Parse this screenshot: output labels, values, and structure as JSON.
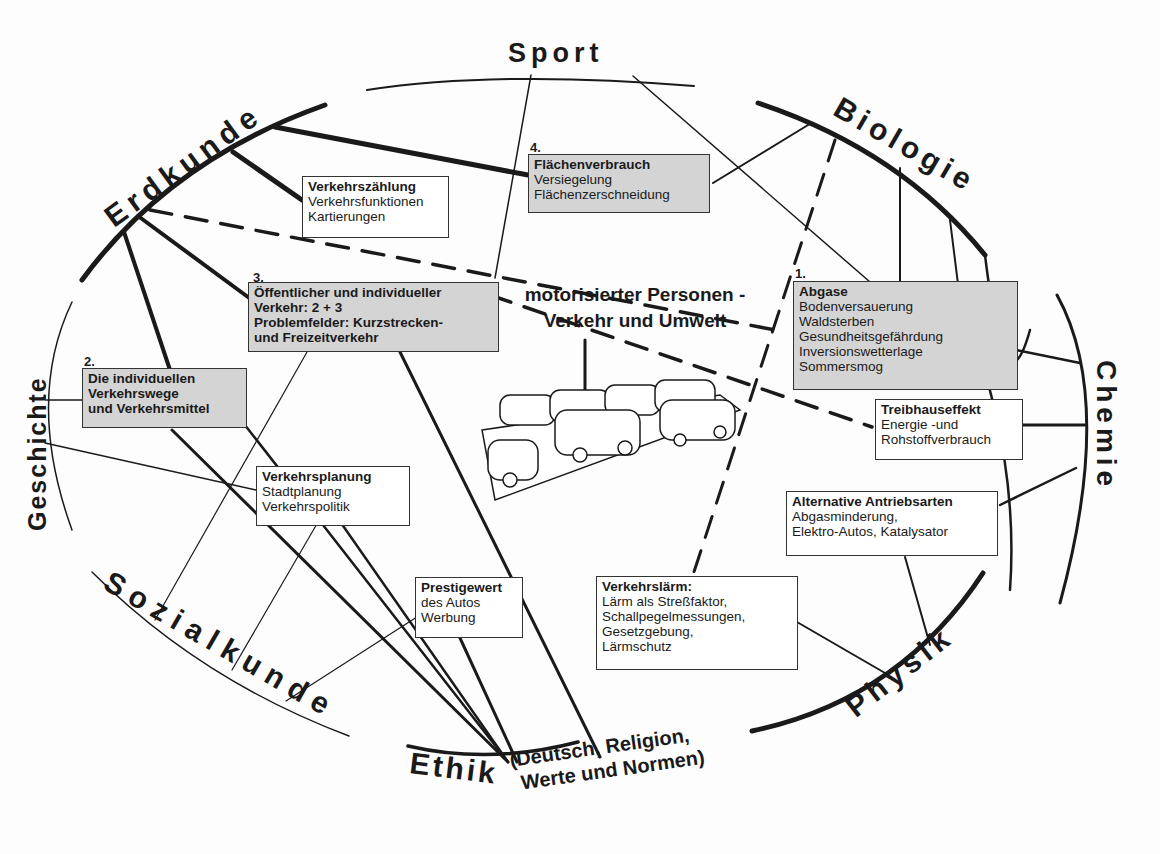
{
  "diagram": {
    "title_line1": "motorisierter Personen -",
    "title_line2": "Verkehr und Umwelt",
    "subjects": {
      "sport": "Sport",
      "biologie": "Biologie",
      "chemie": "Chemie",
      "physik": "Physik",
      "ethik": "Ethik",
      "ethik_sub1": "(Deutsch, Religion,",
      "ethik_sub2": "Werte und Normen)",
      "sozialkunde": "Sozialkunde",
      "geschichte": "Geschichte",
      "erdkunde": "Erdkunde"
    },
    "topics": {
      "abgase": {
        "number": "1.",
        "title": "Abgase",
        "lines": [
          "Bodenversauerung",
          "Waldsterben",
          "Gesundheitsgefährdung",
          "Inversionswetterlage",
          "Sommersmog"
        ]
      },
      "individuell": {
        "number": "2.",
        "lines": [
          "Die individuellen",
          "Verkehrswege",
          "und Verkehrsmittel"
        ]
      },
      "oeffentlich": {
        "number": "3.",
        "lines": [
          "Öffentlicher und individueller",
          "Verkehr: 2 + 3",
          "Problemfelder: Kurzstrecken-",
          "und Freizeitverkehr"
        ]
      },
      "flaechen": {
        "number": "4.",
        "title": "Flächenverbrauch",
        "lines": [
          "Versiegelung",
          "Flächenzerschneidung"
        ]
      },
      "zaehlung": {
        "title": "Verkehrszählung",
        "lines": [
          "Verkehrsfunktionen",
          "Kartierungen"
        ]
      },
      "treibhaus": {
        "title": "Treibhauseffekt",
        "lines": [
          "Energie -und",
          "Rohstoffverbrauch"
        ]
      },
      "antrieb": {
        "title": "Alternative Antriebsarten",
        "lines": [
          "Abgasminderung,",
          "Elektro-Autos, Katalysator"
        ]
      },
      "planung": {
        "title": "Verkehrsplanung",
        "lines": [
          "Stadtplanung",
          "Verkehrspolitik"
        ]
      },
      "prestige": {
        "title": "Prestigewert",
        "lines": [
          "des Autos",
          "Werbung"
        ]
      },
      "laerm": {
        "title": "Verkehrslärm:",
        "lines": [
          "Lärm als Streßfaktor,",
          "Schallpegelmessungen,",
          "Gesetzgebung,",
          "Lärmschutz"
        ]
      }
    },
    "colors": {
      "ink": "#1a1a1a",
      "shaded_box": "#d4d4d4",
      "paper": "#fdfdfd"
    }
  }
}
